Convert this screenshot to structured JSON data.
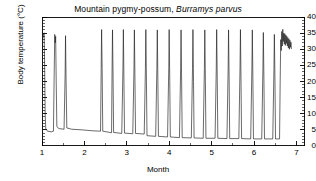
{
  "chart_data": {
    "type": "line",
    "title_plain": "Mountain pygmy-possum, Burramys parvus",
    "title_common": "Mountain pygmy-possum, ",
    "title_species": "Burramys parvus",
    "xlabel": "Month",
    "ylabel": "Body temperature (°C)",
    "xlim": [
      1,
      7.2
    ],
    "ylim": [
      0,
      40
    ],
    "xticks": [
      1,
      2,
      3,
      4,
      5,
      6,
      7
    ],
    "xtick_labels": [
      "1",
      "2",
      "3",
      "4",
      "5",
      "6",
      "7"
    ],
    "x_minor_step": 0.5,
    "yticks": [
      0,
      5,
      10,
      15,
      20,
      25,
      30,
      35,
      40
    ],
    "ytick_labels": [
      "0",
      "5",
      "10",
      "15",
      "20",
      "25",
      "30",
      "35",
      "40"
    ],
    "y_minor_step": 1,
    "grid": false,
    "legend": null,
    "line_color": "#1a1a1a",
    "series_name": "Body temperature",
    "torpor_baseline_start_c": 5.0,
    "torpor_baseline_end_c": 2.2,
    "arousal_peak_c": 36.0,
    "normothermy_range_c": [
      29.5,
      36.2
    ],
    "arousal_peaks_month": [
      1.05,
      1.3,
      1.55,
      1.8,
      2.4,
      2.65,
      2.92,
      3.18,
      3.45,
      3.72,
      4.0,
      4.28,
      4.56,
      4.84,
      5.12,
      5.4,
      5.68,
      5.96,
      6.22,
      6.48
    ],
    "normothermy_start_month": 6.62,
    "points": [
      {
        "x": 1.0,
        "y": 33.4
      },
      {
        "x": 1.012,
        "y": 35.2
      },
      {
        "x": 1.022,
        "y": 33.6
      },
      {
        "x": 1.032,
        "y": 35.0
      },
      {
        "x": 1.042,
        "y": 34.6
      },
      {
        "x": 1.05,
        "y": 35.1
      },
      {
        "x": 1.062,
        "y": 25.0
      },
      {
        "x": 1.075,
        "y": 10.0
      },
      {
        "x": 1.088,
        "y": 5.4
      },
      {
        "x": 1.13,
        "y": 4.6
      },
      {
        "x": 1.22,
        "y": 4.4
      },
      {
        "x": 1.27,
        "y": 4.6
      },
      {
        "x": 1.285,
        "y": 20.0
      },
      {
        "x": 1.3,
        "y": 34.6
      },
      {
        "x": 1.312,
        "y": 32.0
      },
      {
        "x": 1.322,
        "y": 34.0
      },
      {
        "x": 1.335,
        "y": 20.0
      },
      {
        "x": 1.35,
        "y": 6.0
      },
      {
        "x": 1.4,
        "y": 5.4
      },
      {
        "x": 1.52,
        "y": 5.2
      },
      {
        "x": 1.545,
        "y": 22.0
      },
      {
        "x": 1.555,
        "y": 34.2
      },
      {
        "x": 1.568,
        "y": 20.0
      },
      {
        "x": 1.585,
        "y": 5.6
      },
      {
        "x": 1.7,
        "y": 5.2
      },
      {
        "x": 1.95,
        "y": 5.0
      },
      {
        "x": 2.2,
        "y": 4.7
      },
      {
        "x": 2.38,
        "y": 4.6
      },
      {
        "x": 2.395,
        "y": 24.0
      },
      {
        "x": 2.405,
        "y": 36.1
      },
      {
        "x": 2.418,
        "y": 24.0
      },
      {
        "x": 2.432,
        "y": 4.6
      },
      {
        "x": 2.6,
        "y": 4.2
      },
      {
        "x": 2.64,
        "y": 4.1
      },
      {
        "x": 2.652,
        "y": 24.0
      },
      {
        "x": 2.662,
        "y": 36.0
      },
      {
        "x": 2.675,
        "y": 22.0
      },
      {
        "x": 2.688,
        "y": 4.2
      },
      {
        "x": 2.88,
        "y": 3.9
      },
      {
        "x": 2.908,
        "y": 24.0
      },
      {
        "x": 2.918,
        "y": 36.1
      },
      {
        "x": 2.932,
        "y": 20.0
      },
      {
        "x": 2.945,
        "y": 4.0
      },
      {
        "x": 3.14,
        "y": 3.8
      },
      {
        "x": 3.168,
        "y": 24.0
      },
      {
        "x": 3.178,
        "y": 36.0
      },
      {
        "x": 3.192,
        "y": 20.0
      },
      {
        "x": 3.205,
        "y": 3.9
      },
      {
        "x": 3.41,
        "y": 3.7
      },
      {
        "x": 3.438,
        "y": 24.0
      },
      {
        "x": 3.448,
        "y": 36.1
      },
      {
        "x": 3.462,
        "y": 20.0
      },
      {
        "x": 3.475,
        "y": 3.2
      },
      {
        "x": 3.68,
        "y": 3.0
      },
      {
        "x": 3.708,
        "y": 24.0
      },
      {
        "x": 3.718,
        "y": 36.0
      },
      {
        "x": 3.732,
        "y": 20.0
      },
      {
        "x": 3.745,
        "y": 3.0
      },
      {
        "x": 3.96,
        "y": 2.8
      },
      {
        "x": 3.988,
        "y": 24.0
      },
      {
        "x": 3.998,
        "y": 36.1
      },
      {
        "x": 4.012,
        "y": 20.0
      },
      {
        "x": 4.025,
        "y": 2.8
      },
      {
        "x": 4.24,
        "y": 2.6
      },
      {
        "x": 4.268,
        "y": 24.0
      },
      {
        "x": 4.278,
        "y": 36.0
      },
      {
        "x": 4.292,
        "y": 20.0
      },
      {
        "x": 4.305,
        "y": 2.6
      },
      {
        "x": 4.52,
        "y": 2.5
      },
      {
        "x": 4.548,
        "y": 24.0
      },
      {
        "x": 4.558,
        "y": 36.1
      },
      {
        "x": 4.572,
        "y": 20.0
      },
      {
        "x": 4.585,
        "y": 2.5
      },
      {
        "x": 4.8,
        "y": 2.4
      },
      {
        "x": 4.828,
        "y": 24.0
      },
      {
        "x": 4.838,
        "y": 36.0
      },
      {
        "x": 4.852,
        "y": 20.0
      },
      {
        "x": 4.865,
        "y": 2.4
      },
      {
        "x": 5.08,
        "y": 2.4
      },
      {
        "x": 5.108,
        "y": 24.0
      },
      {
        "x": 5.118,
        "y": 36.1
      },
      {
        "x": 5.132,
        "y": 20.0
      },
      {
        "x": 5.145,
        "y": 2.4
      },
      {
        "x": 5.36,
        "y": 2.3
      },
      {
        "x": 5.388,
        "y": 24.0
      },
      {
        "x": 5.398,
        "y": 36.0
      },
      {
        "x": 5.412,
        "y": 20.0
      },
      {
        "x": 5.425,
        "y": 2.3
      },
      {
        "x": 5.64,
        "y": 2.3
      },
      {
        "x": 5.668,
        "y": 24.0
      },
      {
        "x": 5.678,
        "y": 36.1
      },
      {
        "x": 5.692,
        "y": 20.0
      },
      {
        "x": 5.705,
        "y": 2.3
      },
      {
        "x": 5.92,
        "y": 2.2
      },
      {
        "x": 5.948,
        "y": 24.0
      },
      {
        "x": 5.958,
        "y": 36.0
      },
      {
        "x": 5.972,
        "y": 20.0
      },
      {
        "x": 5.985,
        "y": 2.2
      },
      {
        "x": 6.18,
        "y": 2.2
      },
      {
        "x": 6.208,
        "y": 24.0
      },
      {
        "x": 6.218,
        "y": 35.2
      },
      {
        "x": 6.232,
        "y": 20.0
      },
      {
        "x": 6.245,
        "y": 2.2
      },
      {
        "x": 6.44,
        "y": 2.2
      },
      {
        "x": 6.468,
        "y": 24.0
      },
      {
        "x": 6.478,
        "y": 34.6
      },
      {
        "x": 6.492,
        "y": 20.0
      },
      {
        "x": 6.505,
        "y": 2.2
      },
      {
        "x": 6.6,
        "y": 2.2
      },
      {
        "x": 6.615,
        "y": 20.0
      },
      {
        "x": 6.628,
        "y": 33.0
      },
      {
        "x": 6.64,
        "y": 29.6
      },
      {
        "x": 6.652,
        "y": 35.5
      },
      {
        "x": 6.664,
        "y": 31.0
      },
      {
        "x": 6.676,
        "y": 36.2
      },
      {
        "x": 6.688,
        "y": 32.4
      },
      {
        "x": 6.7,
        "y": 35.0
      },
      {
        "x": 6.712,
        "y": 31.6
      },
      {
        "x": 6.724,
        "y": 34.8
      },
      {
        "x": 6.736,
        "y": 31.2
      },
      {
        "x": 6.748,
        "y": 34.4
      },
      {
        "x": 6.76,
        "y": 31.8
      },
      {
        "x": 6.772,
        "y": 34.0
      },
      {
        "x": 6.784,
        "y": 31.0
      },
      {
        "x": 6.796,
        "y": 33.6
      },
      {
        "x": 6.808,
        "y": 30.4
      },
      {
        "x": 6.82,
        "y": 33.2
      },
      {
        "x": 6.832,
        "y": 30.0
      },
      {
        "x": 6.844,
        "y": 32.8
      },
      {
        "x": 6.856,
        "y": 30.6
      },
      {
        "x": 6.868,
        "y": 32.2
      },
      {
        "x": 6.88,
        "y": 30.2
      }
    ]
  }
}
